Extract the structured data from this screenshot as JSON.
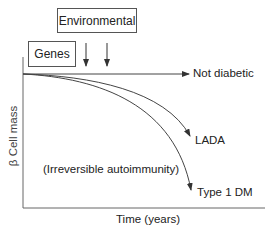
{
  "diagram": {
    "factors": {
      "environmental": "Environmental",
      "genes": "Genes"
    },
    "axes": {
      "xlabel": "Time (years)",
      "ylabel": "β Cell mass"
    },
    "curves": [
      {
        "label": "Not diabetic"
      },
      {
        "label": "LADA"
      },
      {
        "label": "Type 1 DM"
      }
    ],
    "annotation": "(Irreversible autoimmunity)",
    "colors": {
      "line": "#444444",
      "box_border": "#555555",
      "background": "#ffffff"
    }
  }
}
